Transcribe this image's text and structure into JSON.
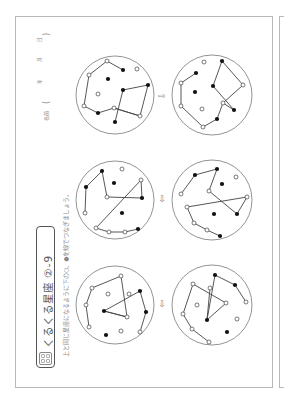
{
  "worksheet": {
    "title": "くるくる星座 ②-9",
    "instruction": "上と同じ星座になるように下の○、●を線でつなぎましょう。",
    "name_label": "名前",
    "date_labels": [
      "年",
      "月",
      "日"
    ],
    "arrow_glyph": "⇨",
    "icon": "thinking-badge-icon"
  },
  "puzzles": [
    {
      "id": 1,
      "position": "right",
      "label": "top-right-pair"
    },
    {
      "id": 2,
      "position": "middle",
      "label": "middle-pair"
    },
    {
      "id": 3,
      "position": "left",
      "label": "bottom-left-pair"
    }
  ],
  "colors": {
    "border": "#b8b8b8",
    "line": "#555555",
    "filled_dot": "#111111",
    "open_dot": "#ffffff"
  }
}
